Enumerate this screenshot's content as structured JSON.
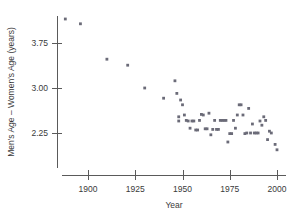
{
  "chart_data": {
    "type": "scatter",
    "title": "",
    "xlabel": "Year",
    "ylabel": "Men's Age – Women's Age (years)",
    "xlim": [
      1886,
      2003
    ],
    "ylim": [
      2.0,
      4.2
    ],
    "xticks": [
      1900,
      1925,
      1950,
      1975,
      2000
    ],
    "xticklabels": [
      "1900",
      "1925",
      "1950",
      "1975",
      "2000"
    ],
    "yticks": [
      2.25,
      3.0,
      3.75
    ],
    "yticklabels": [
      "2.25",
      "3.00",
      "3.75"
    ],
    "grid": false,
    "legend": null,
    "marker": "square",
    "marker_color": "#6b6b78",
    "series": [
      {
        "name": "Men's Age minus Women's Age",
        "points": [
          [
            1888,
            4.15
          ],
          [
            1896,
            4.07
          ],
          [
            1910,
            3.48
          ],
          [
            1921,
            3.38
          ],
          [
            1930,
            3.0
          ],
          [
            1940,
            2.83
          ],
          [
            1946,
            3.12
          ],
          [
            1947,
            2.91
          ],
          [
            1948,
            2.45
          ],
          [
            1948,
            2.52
          ],
          [
            1949,
            2.8
          ],
          [
            1950,
            2.72
          ],
          [
            1951,
            2.55
          ],
          [
            1952,
            2.46
          ],
          [
            1953,
            2.45
          ],
          [
            1954,
            2.33
          ],
          [
            1955,
            2.45
          ],
          [
            1956,
            2.45
          ],
          [
            1957,
            2.3
          ],
          [
            1958,
            2.3
          ],
          [
            1959,
            2.46
          ],
          [
            1960,
            2.56
          ],
          [
            1961,
            2.55
          ],
          [
            1962,
            2.32
          ],
          [
            1963,
            2.32
          ],
          [
            1964,
            2.58
          ],
          [
            1965,
            2.22
          ],
          [
            1966,
            2.31
          ],
          [
            1967,
            2.46
          ],
          [
            1968,
            2.31
          ],
          [
            1969,
            2.31
          ],
          [
            1970,
            2.46
          ],
          [
            1971,
            2.46
          ],
          [
            1972,
            2.46
          ],
          [
            1973,
            2.46
          ],
          [
            1974,
            2.1
          ],
          [
            1975,
            2.24
          ],
          [
            1976,
            2.24
          ],
          [
            1977,
            2.46
          ],
          [
            1978,
            2.33
          ],
          [
            1979,
            2.55
          ],
          [
            1980,
            2.72
          ],
          [
            1981,
            2.72
          ],
          [
            1982,
            2.55
          ],
          [
            1983,
            2.24
          ],
          [
            1984,
            2.25
          ],
          [
            1985,
            2.66
          ],
          [
            1986,
            2.25
          ],
          [
            1987,
            2.4
          ],
          [
            1988,
            2.25
          ],
          [
            1989,
            2.25
          ],
          [
            1990,
            2.25
          ],
          [
            1991,
            2.45
          ],
          [
            1992,
            2.38
          ],
          [
            1993,
            2.52
          ],
          [
            1994,
            2.46
          ],
          [
            1995,
            2.14
          ],
          [
            1996,
            2.28
          ],
          [
            1997,
            2.25
          ],
          [
            1999,
            2.06
          ],
          [
            2000,
            1.97
          ]
        ]
      }
    ]
  },
  "axes": {
    "x_axis_name": "Year",
    "y_axis_name": "Men's Age – Women's Age (years)"
  }
}
